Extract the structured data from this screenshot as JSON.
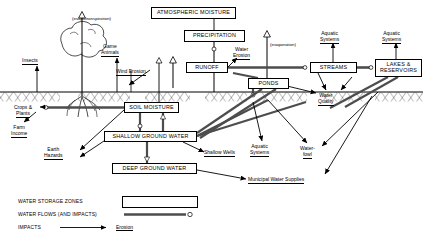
{
  "diagram": {
    "ground_line_y": 92
  },
  "storage_zones": [
    {
      "id": "atmospheric-moisture",
      "label": "ATMOSPHERIC MOISTURE",
      "x": 151,
      "y": 7,
      "w": 85,
      "h": 12
    },
    {
      "id": "precipitation",
      "label": "PRECIPITATION",
      "x": 184,
      "y": 30,
      "w": 61,
      "h": 12
    },
    {
      "id": "runoff",
      "label": "RUNOFF",
      "x": 186,
      "y": 62,
      "w": 42,
      "h": 11
    },
    {
      "id": "ponds",
      "label": "PONDS",
      "x": 248,
      "y": 78,
      "w": 41,
      "h": 11
    },
    {
      "id": "streams",
      "label": "STREAMS",
      "x": 310,
      "y": 62,
      "w": 47,
      "h": 11
    },
    {
      "id": "lakes-reservoirs",
      "label": "LAKES & RESERVOIRS",
      "x": 375,
      "y": 59,
      "w": 47,
      "h": 18
    },
    {
      "id": "soil-moisture",
      "label": "SOIL MOISTURE",
      "x": 124,
      "y": 102,
      "w": 55,
      "h": 11
    },
    {
      "id": "shallow-ground-water",
      "label": "SHALLOW GROUND WATER",
      "x": 104,
      "y": 131,
      "w": 93,
      "h": 11
    },
    {
      "id": "deep-ground-water",
      "label": "DEEP GROUND WATER",
      "x": 112,
      "y": 163,
      "w": 85,
      "h": 11
    }
  ],
  "flow_labels": [
    {
      "id": "evapotranspiration",
      "text": "(evapotranspiration)",
      "x": 72,
      "y": 16,
      "underline": false,
      "italicish": true
    },
    {
      "id": "evaporation",
      "text": "(evaporation)",
      "x": 270,
      "y": 42,
      "underline": false,
      "italicish": true
    }
  ],
  "impact_labels": [
    {
      "id": "insects",
      "text": "Insects",
      "x": 22,
      "y": 58,
      "underline": true
    },
    {
      "id": "game-animals",
      "line1": "Game",
      "line2": "Animals",
      "x": 101,
      "y": 44,
      "underline": true
    },
    {
      "id": "wind-erosion",
      "text": "Wind Erosion",
      "x": 116,
      "y": 69,
      "underline": true
    },
    {
      "id": "water-erosion",
      "line1": "Water",
      "line2": "Erosion",
      "x": 233,
      "y": 47,
      "underline": true
    },
    {
      "id": "aquatic-systems-streams",
      "line1": "Aquatic",
      "line2": "Systems",
      "x": 320,
      "y": 31,
      "underline": true
    },
    {
      "id": "aquatic-systems-lakes",
      "line1": "Aquatic",
      "line2": "Systems",
      "x": 382,
      "y": 31,
      "underline": true
    },
    {
      "id": "crops-plants",
      "line1": "Crops &",
      "line2": "Plants",
      "x": 21,
      "y": 105,
      "underline": true
    },
    {
      "id": "farm-income",
      "line1": "Farm",
      "line2": "Income",
      "x": 11,
      "y": 125,
      "underline": true
    },
    {
      "id": "earth-hazards",
      "line1": "Earth",
      "line2": "Hazards",
      "x": 44,
      "y": 147,
      "underline": true
    },
    {
      "id": "shallow-wells",
      "text": "Shallow Wells",
      "x": 204,
      "y": 150,
      "underline": true
    },
    {
      "id": "aquatic-systems-ponds",
      "line1": "Aquatic",
      "line2": "Systems",
      "x": 250,
      "y": 144,
      "underline": true
    },
    {
      "id": "water-quality",
      "line1": "Water",
      "line2": "Quality",
      "x": 320,
      "y": 93,
      "underline": true
    },
    {
      "id": "water-fowl",
      "line1": "Water-",
      "line2": "fowl",
      "x": 300,
      "y": 146,
      "underline": true
    },
    {
      "id": "municipal-water-supplies",
      "text": "Municipal Water Supplies",
      "x": 248,
      "y": 177,
      "underline": true
    }
  ],
  "legend": {
    "rows": [
      {
        "id": "water-storage-zones",
        "label": "WATER STORAGE ZONES",
        "symbol": "box"
      },
      {
        "id": "water-flows",
        "label": "WATER FLOWS (AND IMPACTS)",
        "symbol": "flow-arrow"
      },
      {
        "id": "impacts",
        "label": "IMPACTS",
        "symbol": "impact-arrow",
        "example": "Erosion"
      }
    ]
  },
  "colors": {
    "line": "#000000",
    "flow": "#555555",
    "background": "#ffffff"
  }
}
